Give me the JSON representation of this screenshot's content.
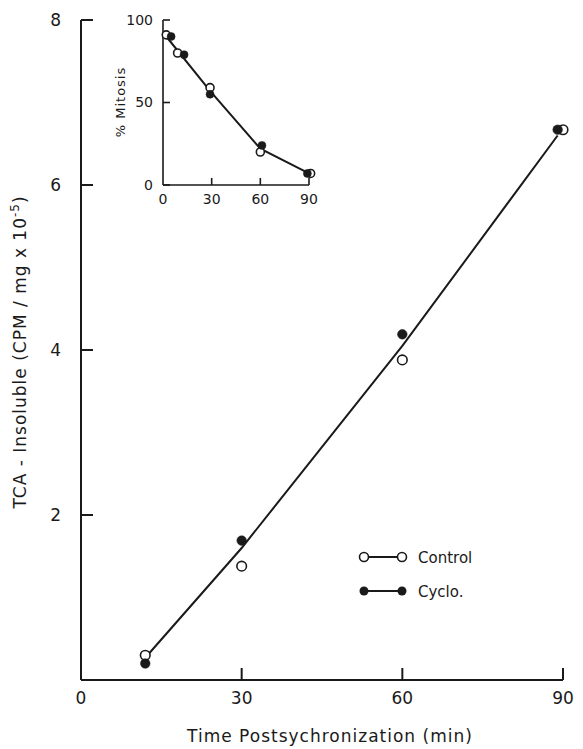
{
  "chart_data": [
    {
      "id": "main",
      "type": "scatter",
      "title": "",
      "xlabel": "Time Postsychronization (min)",
      "ylabel": "TCA - Insoluble (CPM / mg x 10^-5)",
      "ylabel_parts": {
        "main": "TCA - Insoluble  (CPM / mg x 10",
        "sup": "-5",
        "close": ")"
      },
      "xlim": [
        0,
        90
      ],
      "ylim": [
        0,
        8
      ],
      "x_ticks": [
        0,
        30,
        60,
        90
      ],
      "y_ticks": [
        2,
        4,
        6,
        8
      ],
      "grid": false,
      "legend_position": "lower right",
      "series": [
        {
          "name": "Control",
          "marker": "open-circle",
          "x": [
            12,
            30,
            60,
            90
          ],
          "y": [
            0.3,
            1.38,
            3.88,
            6.67
          ]
        },
        {
          "name": "Cyclo.",
          "marker": "filled-circle",
          "x": [
            12,
            30,
            60,
            89
          ],
          "y": [
            0.2,
            1.69,
            4.19,
            6.67
          ]
        }
      ],
      "fit_line": {
        "x": [
          12,
          30,
          60,
          89
        ],
        "y": [
          0.27,
          1.6,
          4.05,
          6.6
        ]
      }
    },
    {
      "id": "inset",
      "type": "line",
      "title": "",
      "xlabel": "",
      "ylabel": "% Mitosis",
      "xlim": [
        0,
        90
      ],
      "ylim": [
        0,
        100
      ],
      "x_ticks": [
        0,
        30,
        60,
        90
      ],
      "y_ticks": [
        0,
        50,
        100
      ],
      "grid": false,
      "series": [
        {
          "name": "Control",
          "marker": "open-circle",
          "x": [
            2,
            9,
            29,
            60,
            91
          ],
          "y": [
            91,
            80,
            59,
            20,
            7
          ]
        },
        {
          "name": "Cyclo.",
          "marker": "filled-circle",
          "x": [
            5,
            13,
            29,
            61,
            89
          ],
          "y": [
            90,
            79,
            55,
            24,
            7
          ]
        }
      ],
      "fit_line": {
        "x": [
          2,
          29,
          60,
          90
        ],
        "y": [
          90,
          57,
          22,
          7
        ]
      }
    }
  ],
  "legend": {
    "items": [
      {
        "label": "Control",
        "marker": "open-circle"
      },
      {
        "label": "Cyclo.",
        "marker": "filled-circle"
      }
    ]
  },
  "colors": {
    "ink": "#1a1a1a",
    "background": "#ffffff"
  }
}
